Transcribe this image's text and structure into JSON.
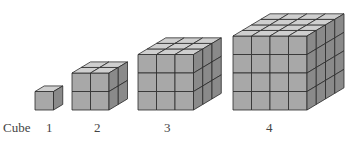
{
  "figure": {
    "row_label": "Cube",
    "colors": {
      "front": "#a8a8a8",
      "top": "#cfcfcf",
      "side": "#8a8a8a",
      "line": "#2a2a2a"
    },
    "cubes": [
      {
        "label": "1",
        "n": 1,
        "x": 35,
        "base": 110,
        "unit": 18.5,
        "label_x": 46
      },
      {
        "label": "2",
        "n": 2,
        "x": 72,
        "base": 110,
        "unit": 18.5,
        "label_x": 94
      },
      {
        "label": "3",
        "n": 3,
        "x": 138,
        "base": 110,
        "unit": 18.5,
        "label_x": 164
      },
      {
        "label": "4",
        "n": 4,
        "x": 233,
        "base": 110,
        "unit": 18.5,
        "label_x": 266
      }
    ]
  }
}
